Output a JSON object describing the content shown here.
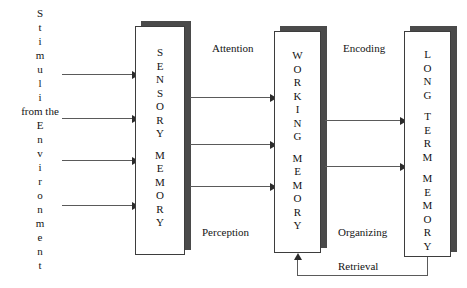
{
  "diagram": {
    "source_label": {
      "line1_letters": [
        "S",
        "t",
        "i",
        "m",
        "u",
        "l",
        "i"
      ],
      "line2_word": "from the",
      "line3_letters": [
        "E",
        "n",
        "v",
        "i",
        "r",
        "o",
        "n",
        "m",
        "e",
        "n",
        "t"
      ]
    },
    "boxes": [
      {
        "id": "sensory-memory",
        "name": "SENSORY MEMORY",
        "word1": [
          "S",
          "E",
          "N",
          "S",
          "O",
          "R",
          "Y"
        ],
        "word2": [
          "M",
          "E",
          "M",
          "O",
          "R",
          "Y"
        ]
      },
      {
        "id": "working-memory",
        "name": "WORKING MEMORY",
        "word1": [
          "W",
          "O",
          "R",
          "K",
          "I",
          "N",
          "G"
        ],
        "word2": [
          "M",
          "E",
          "M",
          "O",
          "R",
          "Y"
        ]
      },
      {
        "id": "long-term-memory",
        "name": "LONG TERM MEMORY",
        "word1": [
          "L",
          "O",
          "N",
          "G"
        ],
        "word2": [
          "T",
          "E",
          "R",
          "M"
        ],
        "word3": [
          "M",
          "E",
          "M",
          "O",
          "R",
          "Y"
        ]
      }
    ],
    "process_labels": {
      "attention": "Attention",
      "perception": "Perception",
      "encoding": "Encoding",
      "organizing": "Organizing",
      "retrieval": "Retrieval"
    },
    "colors": {
      "background": "#ffffff",
      "box_border": "#3d3d3d",
      "box_shadow": "#4a4a4a",
      "line": "#5a5a5a",
      "arrowhead": "#2b2b2b",
      "text": "#141414"
    },
    "counts": {
      "stimulus_arrows": 4,
      "sensory_to_working_arrows": 3,
      "working_to_longterm_arrows": 2,
      "feedback_arrows": 1
    }
  }
}
